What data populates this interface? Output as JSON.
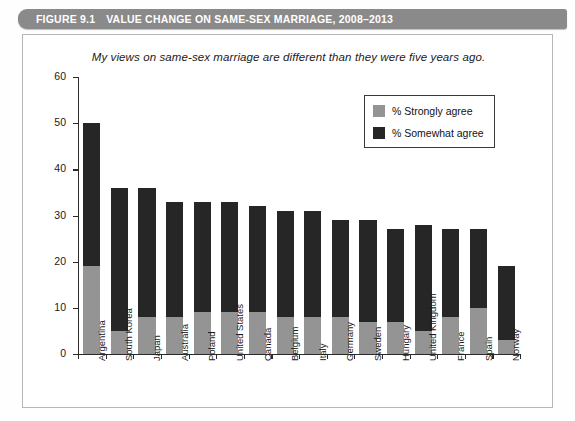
{
  "header": {
    "figure_label": "FIGURE 9.1",
    "figure_title": "VALUE CHANGE ON SAME-SEX MARRIAGE, 2008–2013",
    "band_color": "#8a8a8a"
  },
  "legend": {
    "position": "inside-top-right",
    "entries": [
      {
        "label": "% Strongly agree",
        "color": "#949494"
      },
      {
        "label": "% Somewhat agree",
        "color": "#262626"
      }
    ]
  },
  "chart_data": {
    "type": "bar",
    "stacked": true,
    "title": "My views on same-sex marriage are different than they were five years ago.",
    "xlabel": "",
    "ylabel": "",
    "ylim": [
      0,
      60
    ],
    "yticks": [
      0,
      10,
      20,
      30,
      40,
      50,
      60
    ],
    "ytick_labels": [
      "0",
      "10",
      "20",
      "30",
      "40",
      "50",
      "60"
    ],
    "grid": false,
    "categories": [
      "Argentina",
      "South Korea",
      "Japan",
      "Australia",
      "Poland",
      "United States",
      "Canada",
      "Belgium",
      "Italy",
      "Germany",
      "Sweden",
      "Hungary",
      "United Kingdom",
      "France",
      "Spain",
      "Norway"
    ],
    "series": [
      {
        "name": "% Strongly agree",
        "color": "#949494",
        "values": [
          19,
          5,
          8,
          8,
          9,
          9,
          9,
          8,
          8,
          8,
          7,
          7,
          5,
          8,
          10,
          3
        ]
      },
      {
        "name": "% Somewhat agree",
        "color": "#262626",
        "values": [
          31,
          31,
          28,
          25,
          24,
          24,
          23,
          23,
          23,
          21,
          22,
          20,
          23,
          19,
          17,
          16
        ]
      }
    ],
    "totals": [
      50,
      36,
      36,
      33,
      33,
      33,
      32,
      31,
      31,
      29,
      29,
      27,
      28,
      27,
      27,
      19
    ]
  }
}
